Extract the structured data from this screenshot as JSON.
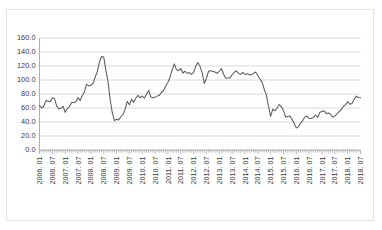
{
  "chart_data": {
    "type": "line",
    "title": "",
    "subtitle": "",
    "xlabel": "",
    "ylabel": "",
    "ylim": [
      0.0,
      160.0
    ],
    "y_ticks": [
      "0.0",
      "20.0",
      "40.0",
      "60.0",
      "80.0",
      "100.0",
      "120.0",
      "140.0",
      "160.0"
    ],
    "y_tick_values": [
      0.0,
      20.0,
      40.0,
      60.0,
      80.0,
      100.0,
      120.0,
      140.0,
      160.0
    ],
    "grid": true,
    "legend": false,
    "legend_position": "none",
    "x_tick_labels": [
      "2006. 01",
      "2006. 07",
      "2007. 01",
      "2007. 07",
      "2008. 01",
      "2008. 07",
      "2009. 01",
      "2009. 07",
      "2010. 01",
      "2010. 07",
      "2011. 01",
      "2011. 07",
      "2012. 01",
      "2012. 07",
      "2013. 01",
      "2013. 07",
      "2014. 01",
      "2014. 07",
      "2015. 01",
      "2015. 07",
      "2016. 01",
      "2016. 07",
      "2017. 01",
      "2017. 07",
      "2018. 01",
      "2018. 07"
    ],
    "x_tick_indices": [
      0,
      6,
      12,
      18,
      24,
      30,
      36,
      42,
      48,
      54,
      60,
      66,
      72,
      78,
      84,
      90,
      96,
      102,
      108,
      114,
      120,
      126,
      132,
      138,
      144,
      150
    ],
    "x_start": "2006. 01",
    "x_end": "2018. 07",
    "x_interval": "monthly",
    "series": [
      {
        "name": "series-1",
        "color": "#5a5a5a",
        "values": [
          63.5,
          60.0,
          62.5,
          70.5,
          70.0,
          69.0,
          74.5,
          73.5,
          63.0,
          58.5,
          59.5,
          62.5,
          54.0,
          59.0,
          62.0,
          68.0,
          68.0,
          68.5,
          75.0,
          70.5,
          78.0,
          83.0,
          94.0,
          91.5,
          92.5,
          95.0,
          104.0,
          112.0,
          125.5,
          133.5,
          133.0,
          114.0,
          98.0,
          72.5,
          53.5,
          42.0,
          44.0,
          43.0,
          47.5,
          50.5,
          58.0,
          69.5,
          64.5,
          72.5,
          68.0,
          74.0,
          78.0,
          74.5,
          77.0,
          74.0,
          79.5,
          85.0,
          76.0,
          74.5,
          75.5,
          77.0,
          78.0,
          82.5,
          85.0,
          91.5,
          96.5,
          104.0,
          114.5,
          123.0,
          114.5,
          113.5,
          116.5,
          110.0,
          112.5,
          109.5,
          110.5,
          108.0,
          111.0,
          119.5,
          125.0,
          119.5,
          110.5,
          95.0,
          102.5,
          112.5,
          113.5,
          112.0,
          111.5,
          109.5,
          112.5,
          116.5,
          108.5,
          102.5,
          103.0,
          103.0,
          107.5,
          111.0,
          113.0,
          109.5,
          108.0,
          111.0,
          108.0,
          109.0,
          107.5,
          107.5,
          109.5,
          111.5,
          106.5,
          101.5,
          97.0,
          87.0,
          78.5,
          62.5,
          48.0,
          58.5,
          56.0,
          60.0,
          65.0,
          62.0,
          56.5,
          47.0,
          48.0,
          48.5,
          44.0,
          38.0,
          31.5,
          33.0,
          38.5,
          42.0,
          47.0,
          48.5,
          45.0,
          45.5,
          46.5,
          50.0,
          46.5,
          54.0,
          55.0,
          56.0,
          52.0,
          53.0,
          51.0,
          47.0,
          48.5,
          51.5,
          55.0,
          57.5,
          62.5,
          64.5,
          69.0,
          65.5,
          66.5,
          72.0,
          77.0,
          75.0,
          74.5
        ]
      }
    ]
  }
}
